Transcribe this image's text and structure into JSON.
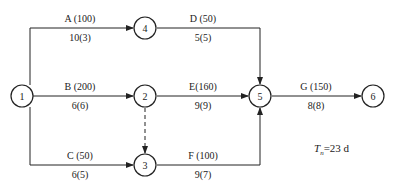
{
  "nodes": [
    {
      "id": "1",
      "label": "1",
      "x": 22,
      "y": 96
    },
    {
      "id": "4",
      "label": "4",
      "x": 145,
      "y": 28
    },
    {
      "id": "2",
      "label": "2",
      "x": 145,
      "y": 96
    },
    {
      "id": "3",
      "label": "3",
      "x": 145,
      "y": 165
    },
    {
      "id": "5",
      "label": "5",
      "x": 260,
      "y": 96
    },
    {
      "id": "6",
      "label": "6",
      "x": 373,
      "y": 96
    }
  ],
  "activities": [
    {
      "name": "A",
      "top": "A (100)",
      "bottom": "10(3)"
    },
    {
      "name": "B",
      "top": "B (200)",
      "bottom": "6(6)"
    },
    {
      "name": "C",
      "top": "C (50)",
      "bottom": "6(5)"
    },
    {
      "name": "D",
      "top": "D (50)",
      "bottom": "5(5)"
    },
    {
      "name": "E",
      "top": "E(160)",
      "bottom": "9(9)"
    },
    {
      "name": "F",
      "top": "F (100)",
      "bottom": "9(7)"
    },
    {
      "name": "G",
      "top": "G (150)",
      "bottom": "8(8)"
    }
  ],
  "total": {
    "symbol": "T",
    "subscript": "n",
    "value": "=23",
    "unit": "d"
  }
}
